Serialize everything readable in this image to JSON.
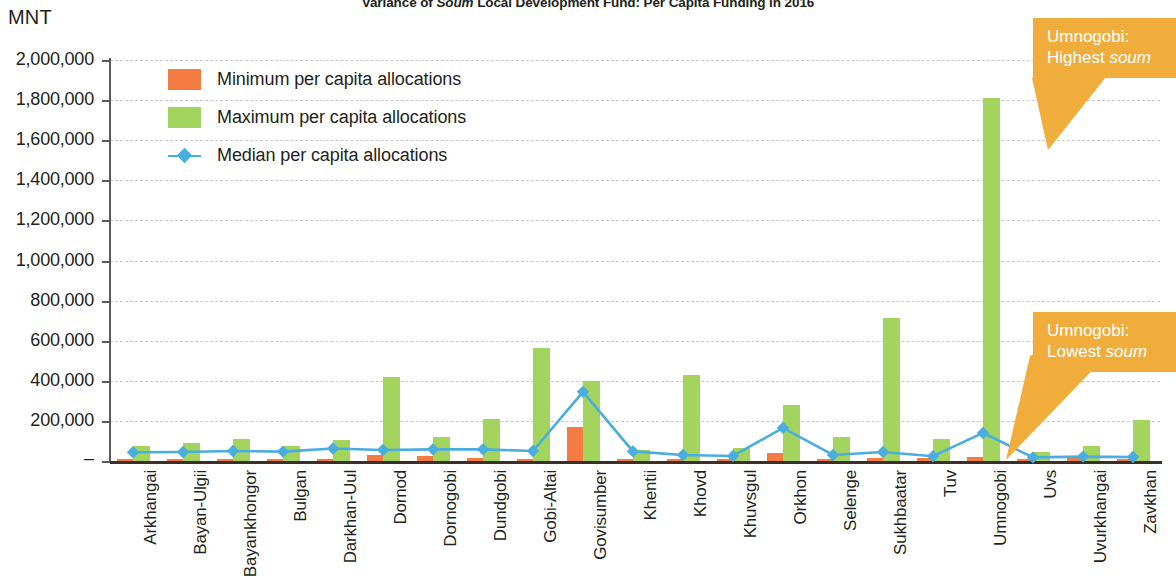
{
  "chart": {
    "title_prefix": "Variance of ",
    "title_italic": "Soum",
    "title_suffix": " Local Development Fund: Per Capita Funding in 2016",
    "axis_unit": "MNT"
  },
  "legend": {
    "items": [
      {
        "label": "Minimum per capita allocations",
        "marker": "square",
        "color": "#F47B41"
      },
      {
        "label": "Maximum per capita allocations",
        "marker": "square",
        "color": "#A2D45E"
      },
      {
        "label": "Median per capita allocations",
        "marker": "line-diamond",
        "color": "#4AADE0"
      }
    ]
  },
  "annotations": [
    {
      "name": "highest-soum-callout",
      "line1": "Umnogobi:",
      "line2_prefix": "Highest ",
      "line2_italic": "soum",
      "color": "#F0AD3C"
    },
    {
      "name": "lowest-soum-callout",
      "line1": "Umnogobi:",
      "line2_prefix": "Lowest ",
      "line2_italic": "soum",
      "color": "#F0AD3C"
    }
  ],
  "chart_data": {
    "type": "bar",
    "title": "Variance of Soum Local Development Fund: Per Capita Funding in 2016",
    "xlabel": "",
    "ylabel": "MNT",
    "ylim": [
      0,
      2000000
    ],
    "ytick_labels": [
      "2,000,000",
      "1,800,000",
      "1,600,000",
      "1,400,000",
      "1,200,000",
      "1,000,000",
      "800,000",
      "600,000",
      "400,000",
      "200,000",
      "–"
    ],
    "ytick_values": [
      2000000,
      1800000,
      1600000,
      1400000,
      1200000,
      1000000,
      800000,
      600000,
      400000,
      200000,
      0
    ],
    "grid": true,
    "legend_position": "inside-top-left",
    "categories": [
      "Arkhangai",
      "Bayan-Ulgii",
      "Bayankhongor",
      "Bulgan",
      "Darkhan-Uul",
      "Dornod",
      "Dornogobi",
      "Dundgobi",
      "Gobi-Altai",
      "Govisumber",
      "Khentii",
      "Khovd",
      "Khuvsgul",
      "Orkhon",
      "Selenge",
      "Sukhbaatar",
      "Tuv",
      "Umnogobi",
      "Uvs",
      "Uvurkhangai",
      "Zavkhan"
    ],
    "series": [
      {
        "name": "Minimum per capita allocations",
        "color": "#F47B41",
        "values": [
          8000,
          9000,
          10000,
          8000,
          12000,
          28000,
          25000,
          14000,
          12000,
          170000,
          12000,
          10000,
          9000,
          40000,
          12000,
          14000,
          14000,
          22000,
          9000,
          15000,
          10000
        ]
      },
      {
        "name": "Maximum per capita allocations",
        "color": "#A2D45E",
        "values": [
          75000,
          90000,
          110000,
          75000,
          105000,
          420000,
          120000,
          210000,
          565000,
          400000,
          55000,
          430000,
          65000,
          280000,
          120000,
          715000,
          110000,
          1810000,
          45000,
          75000,
          205000
        ]
      },
      {
        "name": "Median per capita allocations",
        "color": "#4AADE0",
        "type": "line",
        "values": [
          44000,
          45000,
          50000,
          47000,
          62000,
          55000,
          58000,
          58000,
          50000,
          345000,
          48000,
          30000,
          25000,
          165000,
          30000,
          45000,
          24000,
          140000,
          18000,
          22000,
          20000
        ]
      }
    ]
  }
}
